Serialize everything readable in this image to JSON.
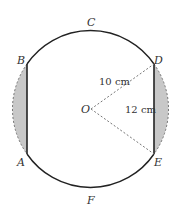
{
  "diagram": {
    "title": "",
    "center": {
      "label": "O"
    },
    "points": {
      "A": "A",
      "B": "B",
      "C": "C",
      "D": "D",
      "E": "E",
      "F": "F"
    },
    "measurements": {
      "radius": "10 cm",
      "chord": "12 cm"
    },
    "colors": {
      "stroke": "#222222",
      "shaded": "#c8c8c8",
      "dashed": "#777777"
    }
  }
}
